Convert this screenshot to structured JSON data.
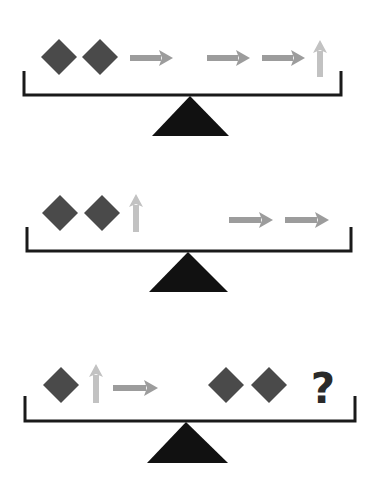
{
  "puzzle": {
    "type": "balance-scale-puzzle",
    "colors": {
      "background": "#ffffff",
      "diamond": "#4a4a4a",
      "right_arrow": "#9c9c9c",
      "up_arrow": "#c2c2c2",
      "scale": "#1a1a1a",
      "fulcrum": "#111111",
      "question_mark": "#2a2a2a"
    },
    "scales": [
      {
        "id": "scale-1",
        "bar": {
          "x1": 24,
          "x2": 341,
          "y": 95,
          "wall_top": 71
        },
        "fulcrum": {
          "apex_x": 190,
          "apex_y": 96,
          "base_left": 152,
          "base_right": 229,
          "base_y": 136
        },
        "left_pan": [
          {
            "kind": "diamond",
            "cx": 59,
            "cy": 57
          },
          {
            "kind": "diamond",
            "cx": 100,
            "cy": 57
          },
          {
            "kind": "right-arrow",
            "x": 130,
            "y": 58,
            "length": 43
          }
        ],
        "right_pan": [
          {
            "kind": "right-arrow",
            "x": 207,
            "y": 58,
            "length": 43
          },
          {
            "kind": "right-arrow",
            "x": 262,
            "y": 58,
            "length": 43
          },
          {
            "kind": "up-arrow",
            "x": 320,
            "y": 77,
            "length": 37
          }
        ]
      },
      {
        "id": "scale-2",
        "bar": {
          "x1": 27,
          "x2": 351,
          "y": 251,
          "wall_top": 227
        },
        "fulcrum": {
          "apex_x": 188,
          "apex_y": 252,
          "base_left": 149,
          "base_right": 228,
          "base_y": 292
        },
        "left_pan": [
          {
            "kind": "diamond",
            "cx": 60,
            "cy": 213
          },
          {
            "kind": "diamond",
            "cx": 102,
            "cy": 213
          },
          {
            "kind": "up-arrow",
            "x": 136,
            "y": 232,
            "length": 38
          }
        ],
        "right_pan": [
          {
            "kind": "right-arrow",
            "x": 229,
            "y": 220,
            "length": 44
          },
          {
            "kind": "right-arrow",
            "x": 285,
            "y": 220,
            "length": 44
          }
        ]
      },
      {
        "id": "scale-3",
        "bar": {
          "x1": 25,
          "x2": 355,
          "y": 421,
          "wall_top": 396
        },
        "fulcrum": {
          "apex_x": 186,
          "apex_y": 422,
          "base_left": 147,
          "base_right": 228,
          "base_y": 463
        },
        "left_pan": [
          {
            "kind": "diamond",
            "cx": 61,
            "cy": 385
          },
          {
            "kind": "up-arrow",
            "x": 96,
            "y": 403,
            "length": 39
          },
          {
            "kind": "right-arrow",
            "x": 113,
            "y": 388,
            "length": 45
          }
        ],
        "right_pan": [
          {
            "kind": "diamond",
            "cx": 226,
            "cy": 385
          },
          {
            "kind": "diamond",
            "cx": 269,
            "cy": 385
          },
          {
            "kind": "question",
            "x": 323,
            "y": 403,
            "text": "?"
          }
        ]
      }
    ]
  }
}
